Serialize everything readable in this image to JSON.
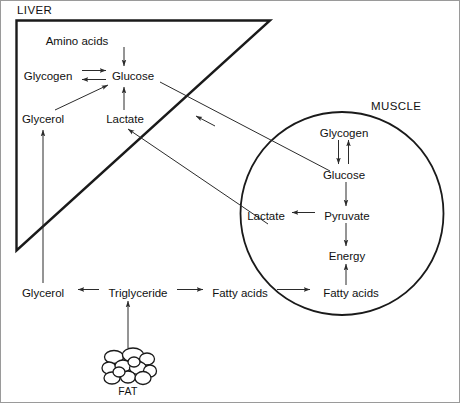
{
  "compartments": {
    "liver": {
      "label": "LIVER",
      "shape": "triangle"
    },
    "muscle": {
      "label": "MUSCLE",
      "shape": "circle"
    }
  },
  "nodes": {
    "liver_amino_acids": {
      "label": "Amino acids",
      "x": 122,
      "y": 41
    },
    "liver_glycogen": {
      "label": "Glycogen",
      "x": 48,
      "y": 76
    },
    "liver_glucose": {
      "label": "Glucose",
      "x": 128,
      "y": 76
    },
    "liver_glycerol": {
      "label": "Glycerol",
      "x": 43,
      "y": 119
    },
    "liver_lactate": {
      "label": "Lactate",
      "x": 125,
      "y": 119
    },
    "muscle_glycogen": {
      "label": "Glycogen",
      "x": 344,
      "y": 133
    },
    "muscle_glucose": {
      "label": "Glucose",
      "x": 344,
      "y": 175
    },
    "muscle_lactate": {
      "label": "Lactate",
      "x": 266,
      "y": 216
    },
    "muscle_pyruvate": {
      "label": "Pyruvate",
      "x": 347,
      "y": 216
    },
    "muscle_energy": {
      "label": "Energy",
      "x": 347,
      "y": 256
    },
    "muscle_fatty_acids": {
      "label": "Fatty acids",
      "x": 351,
      "y": 293
    },
    "blood_glycerol": {
      "label": "Glycerol",
      "x": 43,
      "y": 293
    },
    "blood_triglyceride": {
      "label": "Triglyceride",
      "x": 136,
      "y": 293
    },
    "blood_fatty_acids": {
      "label": "Fatty acids",
      "x": 239,
      "y": 293
    },
    "fat_store": {
      "label": "FAT",
      "x": 128,
      "y": 391
    }
  },
  "edges": [
    {
      "name": "amino-acids-to-glucose",
      "from": "liver_amino_acids",
      "to": "liver_glucose",
      "type": "arrow"
    },
    {
      "name": "glycogen-glucose-reversible",
      "from": "liver_glycogen",
      "to": "liver_glucose",
      "type": "double-arrow"
    },
    {
      "name": "liver-lactate-to-glucose",
      "from": "liver_lactate",
      "to": "liver_glucose",
      "type": "arrow"
    },
    {
      "name": "liver-glycerol-to-glucose",
      "from": "liver_glycerol",
      "to": "liver_glucose",
      "type": "arrow"
    },
    {
      "name": "liver-glucose-to-muscle-glucose",
      "from": "liver_glucose",
      "to": "muscle_glucose",
      "type": "arrow"
    },
    {
      "name": "muscle-lactate-to-liver-lactate",
      "from": "muscle_lactate",
      "to": "liver_lactate",
      "type": "arrow"
    },
    {
      "name": "muscle-glycogen-glucose-reversible",
      "from": "muscle_glycogen",
      "to": "muscle_glucose",
      "type": "double-arrow"
    },
    {
      "name": "muscle-glucose-to-pyruvate",
      "from": "muscle_glucose",
      "to": "muscle_pyruvate",
      "type": "arrow"
    },
    {
      "name": "pyruvate-to-muscle-lactate",
      "from": "muscle_pyruvate",
      "to": "muscle_lactate",
      "type": "arrow"
    },
    {
      "name": "pyruvate-to-energy",
      "from": "muscle_pyruvate",
      "to": "muscle_energy",
      "type": "arrow"
    },
    {
      "name": "muscle-fatty-acids-to-energy",
      "from": "muscle_fatty_acids",
      "to": "muscle_energy",
      "type": "arrow"
    },
    {
      "name": "triglyceride-to-glycerol",
      "from": "blood_triglyceride",
      "to": "blood_glycerol",
      "type": "arrow"
    },
    {
      "name": "triglyceride-to-fatty-acids",
      "from": "blood_triglyceride",
      "to": "blood_fatty_acids",
      "type": "arrow"
    },
    {
      "name": "blood-fatty-acids-to-muscle",
      "from": "blood_fatty_acids",
      "to": "muscle_fatty_acids",
      "type": "arrow"
    },
    {
      "name": "blood-glycerol-to-liver-glycerol",
      "from": "blood_glycerol",
      "to": "liver_glycerol",
      "type": "arrow"
    },
    {
      "name": "fat-to-triglyceride",
      "from": "fat_store",
      "to": "blood_triglyceride",
      "type": "arrow"
    }
  ],
  "colors": {
    "stroke_thin": "#2b2b2b",
    "stroke_thick": "#1a1a1a",
    "frame": "#9a9a9a",
    "text": "#111111",
    "background": "#ffffff"
  }
}
